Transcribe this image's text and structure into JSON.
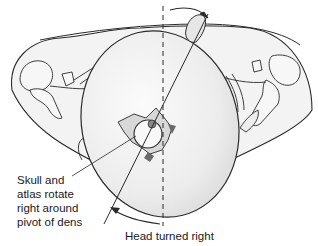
{
  "figure": {
    "labels": {
      "rotation_line1": "Skull and",
      "rotation_line2": "atlas rotate",
      "rotation_line3": "right around",
      "rotation_line4": "pivot of dens",
      "head_turned": "Head turned right"
    },
    "colors": {
      "line": "#2a2a2a",
      "skull_fill": "#ececec",
      "skull_highlight": "#f8f8f8",
      "shoulder_fill": "#f2f2f2",
      "vertebra_fill": "#d6d6d6",
      "vertebra_shadow": "#6a6a6a"
    }
  }
}
